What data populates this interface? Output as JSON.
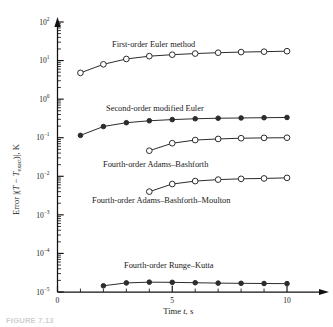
{
  "figure": {
    "caption": "FIGURE 7.13"
  },
  "chart_data": {
    "type": "line",
    "title": "",
    "xlabel": "Time t, s",
    "ylabel_text": "Error |(T − Texact)|, K",
    "ylabel_parts": {
      "prefix": "Error |(",
      "var1": "T",
      "minus": " − ",
      "var2": "T",
      "sub": "exact",
      "suffix": ")|, K"
    },
    "xscale": "linear",
    "yscale": "log",
    "xlim": [
      0,
      11
    ],
    "ylim": [
      1e-05,
      100.0
    ],
    "grid": false,
    "legend_position": "inline-annotations",
    "x_ticks": [
      0,
      5,
      10
    ],
    "x_tick_labels": [
      "0",
      "5",
      "10"
    ],
    "x_minor_ticks": [
      1,
      2,
      3,
      4,
      6,
      7,
      8,
      9
    ],
    "y_ticks": [
      100,
      10,
      1,
      0.1,
      0.01,
      0.001,
      0.0001,
      1e-05
    ],
    "y_tick_labels": [
      "10²",
      "10¹",
      "10⁰",
      "10⁻¹",
      "10⁻²",
      "10⁻³",
      "10⁻⁴",
      "10⁻⁵"
    ],
    "y_tick_exponents": [
      "2",
      "1",
      "0",
      "-1",
      "-2",
      "-3",
      "-4",
      "-5"
    ],
    "series": [
      {
        "name": "First-order Euler method",
        "marker": "open-circle",
        "x": [
          1,
          2,
          3,
          4,
          5,
          6,
          7,
          8,
          9,
          10
        ],
        "values": [
          4.8,
          8.0,
          11.0,
          13.0,
          14.2,
          15.2,
          16.0,
          16.6,
          17.0,
          17.5
        ]
      },
      {
        "name": "Second-order modified Euler",
        "marker": "filled-circle",
        "x": [
          1,
          2,
          3,
          4,
          5,
          6,
          7,
          8,
          9,
          10
        ],
        "values": [
          0.115,
          0.195,
          0.245,
          0.275,
          0.295,
          0.31,
          0.32,
          0.325,
          0.33,
          0.335
        ]
      },
      {
        "name": "Fourth-order Adams–Bashforth",
        "marker": "open-circle",
        "x": [
          4,
          5,
          6,
          7,
          8,
          9,
          10
        ],
        "values": [
          0.046,
          0.072,
          0.087,
          0.093,
          0.097,
          0.099,
          0.1
        ]
      },
      {
        "name": "Fourth-order Adams–Bashforth–Moulton",
        "marker": "open-circle",
        "x": [
          4,
          5,
          6,
          7,
          8,
          9,
          10
        ],
        "values": [
          0.004,
          0.0063,
          0.0075,
          0.0082,
          0.0086,
          0.0088,
          0.0091
        ]
      },
      {
        "name": "Fourth-order Runge–Kutta",
        "marker": "filled-circle",
        "x": [
          2,
          3,
          4,
          5,
          6,
          7,
          8,
          9,
          10
        ],
        "values": [
          1.45e-05,
          1.72e-05,
          1.8e-05,
          1.78e-05,
          1.74e-05,
          1.7e-05,
          1.68e-05,
          1.66e-05,
          1.65e-05
        ]
      }
    ],
    "annotations": [
      {
        "text": "First-order Euler method",
        "x_px": 112,
        "y_px": 40
      },
      {
        "text": "Second-order modified Euler",
        "x_px": 106,
        "y_px": 104
      },
      {
        "text": "Fourth-order Adams–Bashforth",
        "x_px": 103,
        "y_px": 160
      },
      {
        "text": "Fourth-order Adams–Bashforth–Moulton",
        "x_px": 92,
        "y_px": 196
      },
      {
        "text": "Fourth-order Runge–Kutta",
        "x_px": 124,
        "y_px": 261
      }
    ]
  }
}
